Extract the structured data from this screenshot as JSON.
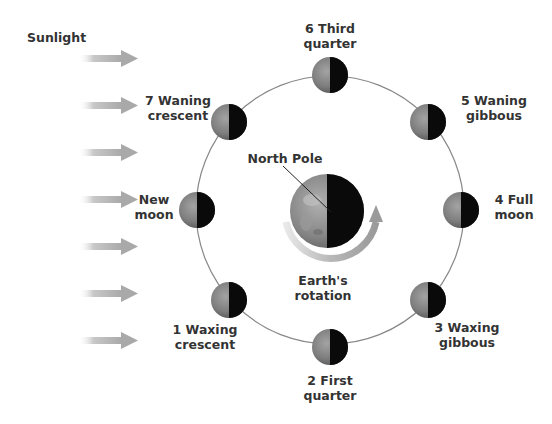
{
  "diagram": {
    "sunlight_label": "Sunlight",
    "earth": {
      "north_pole_label": "North Pole",
      "rotation_label_line1": "Earth's",
      "rotation_label_line2": "rotation"
    },
    "phases": [
      {
        "number": "1",
        "line1": "1 Waxing",
        "line2": "crescent"
      },
      {
        "number": "2",
        "line1": "2 First",
        "line2": "quarter"
      },
      {
        "number": "3",
        "line1": "3 Waxing",
        "line2": "gibbous"
      },
      {
        "number": "4",
        "line1": "4 Full",
        "line2": "moon"
      },
      {
        "number": "5",
        "line1": "5 Waning",
        "line2": "gibbous"
      },
      {
        "number": "6",
        "line1": "6 Third",
        "line2": "quarter"
      },
      {
        "number": "7",
        "line1": "7 Waning",
        "line2": "crescent"
      },
      {
        "number": "0",
        "line1": "New",
        "line2": "moon"
      }
    ],
    "sunlight_arrow_count": 7,
    "colors": {
      "text": "#333333",
      "orbit": "#888888",
      "arrow": "#b5b5b5",
      "moon_lit": "#8a8a8a",
      "moon_dark": "#0a0a0a",
      "rotation_arrow": "#a8a8a8"
    }
  }
}
